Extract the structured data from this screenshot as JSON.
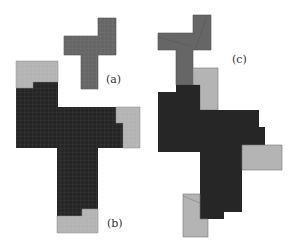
{
  "figure": {
    "colors": {
      "mid_gray": "#666666",
      "dark": "#262626",
      "light_gray": "#b4b4b4",
      "outline": "#555555"
    },
    "panels": [
      {
        "id": "a",
        "label": "(a)"
      },
      {
        "id": "b",
        "label": "(b)"
      },
      {
        "id": "c",
        "label": "(c)"
      }
    ]
  }
}
